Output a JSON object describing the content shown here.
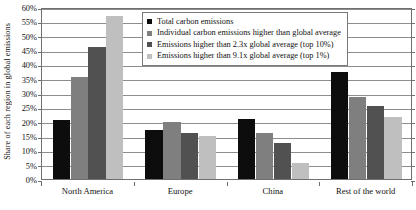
{
  "chart_data": {
    "type": "bar",
    "title": "",
    "xlabel": "",
    "ylabel": "Share of each region in global emissions",
    "ylim": [
      0,
      60
    ],
    "ytick_labels": [
      "0%",
      "5%",
      "10%",
      "15%",
      "20%",
      "25%",
      "30%",
      "35%",
      "40%",
      "45%",
      "50%",
      "55%",
      "60%"
    ],
    "ytick_values": [
      0,
      5,
      10,
      15,
      20,
      25,
      30,
      35,
      40,
      45,
      50,
      55,
      60
    ],
    "grid": true,
    "legend_position": "top-center",
    "categories": [
      "North America",
      "Europe",
      "China",
      "Rest of the world"
    ],
    "series": [
      {
        "name": "Total carbon emissions",
        "color": "#0d0d0d",
        "values": [
          20.5,
          17.0,
          21.0,
          37.5
        ]
      },
      {
        "name": "Individual carbon emissions higher than global average",
        "color": "#7f7f7f",
        "values": [
          35.5,
          20.0,
          16.0,
          28.5
        ]
      },
      {
        "name": "Emissions higher than 2.3x global average (top 10%)",
        "color": "#515151",
        "values": [
          46.0,
          16.0,
          12.5,
          25.5
        ]
      },
      {
        "name": "Emissions higher than 9.1x global average (top 1%)",
        "color": "#bfbfbf",
        "values": [
          57.0,
          15.0,
          5.5,
          21.5
        ]
      }
    ]
  },
  "legend": {
    "items": [
      {
        "label": "Total carbon emissions",
        "color": "#0d0d0d"
      },
      {
        "label": "Individual carbon emissions higher than global average",
        "color": "#7f7f7f"
      },
      {
        "label": "Emissions higher than 2.3x global average (top 10%)",
        "color": "#515151"
      },
      {
        "label": "Emissions higher than 9.1x global average (top 1%)",
        "color": "#bfbfbf"
      }
    ]
  },
  "colors": {
    "axis": "#6f6f6f",
    "gridline": "#8d8d8d",
    "text": "#111111",
    "background": "#ffffff"
  }
}
